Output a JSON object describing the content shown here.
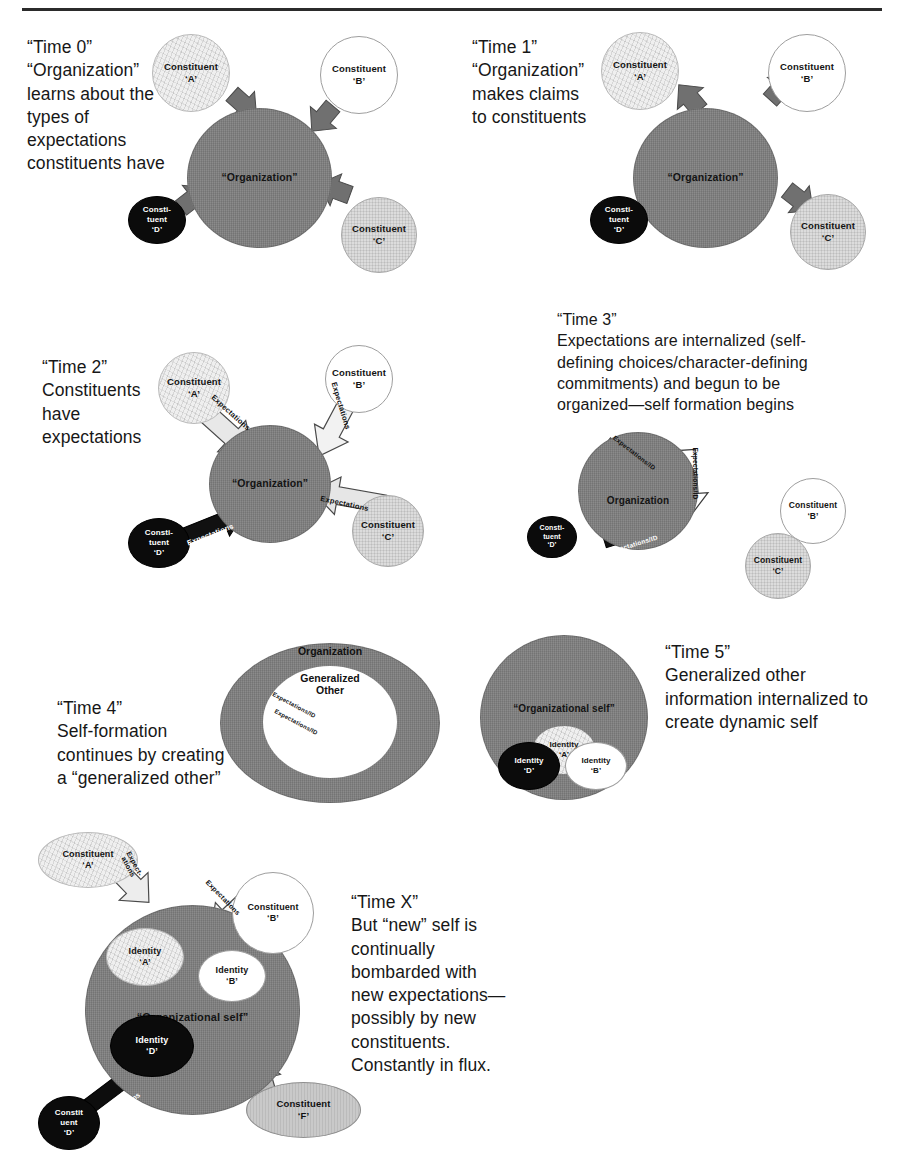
{
  "document": {
    "type": "figure",
    "horizontal_rule": true
  },
  "panels": [
    {
      "id": "time0",
      "caption": "“Time 0”\n“Organization”\nlearns about the\ntypes of\nexpectations\nconstituents have",
      "center_label": "“Organization”",
      "nodes": [
        {
          "name": "constituent-a",
          "l1": "Constituent",
          "l2": "‘A’"
        },
        {
          "name": "constituent-b",
          "l1": "Constituent",
          "l2": "‘B’"
        },
        {
          "name": "constituent-c",
          "l1": "Constituent",
          "l2": "‘C’"
        },
        {
          "name": "constituent-d",
          "l1": "Consti-",
          "l2": "tuent",
          "l3": "‘D’"
        }
      ],
      "arrow_direction": "inward",
      "arrow_labels": []
    },
    {
      "id": "time1",
      "caption": "“Time 1”\n“Organization”\nmakes claims\nto constituents",
      "center_label": "“Organization”",
      "nodes": [
        {
          "name": "constituent-a",
          "l1": "Constituent",
          "l2": "‘A’"
        },
        {
          "name": "constituent-b",
          "l1": "Constituent",
          "l2": "‘B’"
        },
        {
          "name": "constituent-c",
          "l1": "Constituent",
          "l2": "‘C’"
        },
        {
          "name": "constituent-d",
          "l1": "Consti-",
          "l2": "tuent",
          "l3": "‘D’"
        }
      ],
      "arrow_direction": "outward",
      "arrow_labels": []
    },
    {
      "id": "time2",
      "caption": "“Time 2”\nConstituents\nhave\nexpectations",
      "center_label": "“Organization”",
      "nodes": [
        {
          "name": "constituent-a",
          "l1": "Constituent",
          "l2": "‘A’"
        },
        {
          "name": "constituent-b",
          "l1": "Constituent",
          "l2": "‘B’"
        },
        {
          "name": "constituent-c",
          "l1": "Constituent",
          "l2": "‘C’"
        },
        {
          "name": "constituent-d",
          "l1": "Consti-",
          "l2": "tuent",
          "l3": "‘D’"
        }
      ],
      "arrow_direction": "inward",
      "arrow_labels": [
        "Expectations",
        "Expectations",
        "Expectations",
        "Expectations"
      ]
    },
    {
      "id": "time3",
      "caption": "“Time 3”\nExpectations are internalized (self-\ndefining choices/character-defining\ncommitments) and begun to be\norganized—self formation begins",
      "center_label": "Organization",
      "nodes": [
        {
          "name": "constituent-a",
          "l1": "Constituent",
          "l2": "‘A’"
        },
        {
          "name": "constituent-b",
          "l1": "Constituent",
          "l2": "‘B’"
        },
        {
          "name": "constituent-c",
          "l1": "Constituent",
          "l2": "‘C’"
        },
        {
          "name": "constituent-d",
          "l1": "Consti-",
          "l2": "tuent",
          "l3": "‘D’"
        }
      ],
      "arrow_labels": [
        "Expectations/ID",
        "Expectations/ID",
        "Expectations/ID"
      ]
    },
    {
      "id": "time4",
      "caption": "“Time 4”\nSelf-formation\ncontinues by creating\na “generalized other”",
      "outer_label": "Organization",
      "inner_label_1": "Generalized",
      "inner_label_2": "Other",
      "arrow_labels": [
        "Expectations/ID",
        "Expectations/ID",
        "Expectations/ID"
      ]
    },
    {
      "id": "time5",
      "caption": "“Time 5”\nGeneralized other\ninformation internalized to\ncreate dynamic self",
      "center_label": "“Organizational self”",
      "nodes": [
        {
          "name": "identity-a",
          "l1": "Identity",
          "l2": "‘A’"
        },
        {
          "name": "identity-b",
          "l1": "Identity",
          "l2": "‘B’"
        },
        {
          "name": "identity-d",
          "l1": "Identity",
          "l2": "‘D’"
        }
      ]
    },
    {
      "id": "timeX",
      "caption": "“Time X”\nBut “new” self is\ncontinually\nbombarded with\nnew expectations—\npossibly by new\nconstituents.\nConstantly in flux.",
      "center_label": "“Organizational self”",
      "nodes": [
        {
          "name": "constituent-a",
          "l1": "Constituent",
          "l2": "‘A’"
        },
        {
          "name": "constituent-b",
          "l1": "Constituent",
          "l2": "‘B’"
        },
        {
          "name": "constituent-d",
          "l1": "Constit",
          "l2": "uent",
          "l3": "‘D’"
        },
        {
          "name": "constituent-f",
          "l1": "Constituent",
          "l2": "‘F’"
        },
        {
          "name": "identity-a",
          "l1": "Identity",
          "l2": "‘A’"
        },
        {
          "name": "identity-b",
          "l1": "Identity",
          "l2": "‘B’"
        },
        {
          "name": "identity-d",
          "l1": "Identity",
          "l2": "‘D’"
        }
      ],
      "arrow_labels": [
        "Expect-\nations",
        "Expectations",
        "Expectations",
        ""
      ]
    }
  ],
  "colors": {
    "organization_fill": "#8b8b8b",
    "constituent_a_fill": "#efefef",
    "constituent_b_fill": "#ffffff",
    "constituent_c_fill": "#dcdcdc",
    "constituent_d_fill": "#0b0b0b",
    "constituent_f_fill": "#c9c9c9",
    "text": "#171717",
    "rule": "#2b2b2b"
  }
}
